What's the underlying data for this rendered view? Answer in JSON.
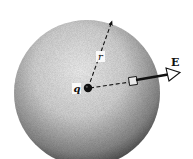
{
  "figure": {
    "labels": {
      "charge": "q",
      "radius": "r",
      "field": "E"
    },
    "colors": {
      "background": "#ffffff",
      "sphere_light": "#f2f2f2",
      "sphere_dark": "#3a3a3a",
      "ink": "#111111"
    }
  }
}
